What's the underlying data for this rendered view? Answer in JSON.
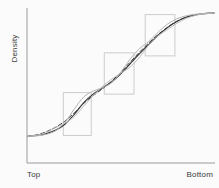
{
  "chart_data": {
    "type": "line",
    "title": "",
    "xlabel": "",
    "ylabel": "Density",
    "x_tick_labels": [
      "Top",
      "Bottom"
    ],
    "grid": false,
    "legend": false,
    "xlim": [
      0,
      1
    ],
    "ylim": [
      0,
      1
    ],
    "axis_color": "#9a9a9a",
    "highlight_boxes": [
      {
        "name": "lower-transition-box",
        "x0": 0.19,
        "x1": 0.34,
        "y0": 0.18,
        "y1": 0.46,
        "color": "#cccccc"
      },
      {
        "name": "middle-transition-box",
        "x0": 0.41,
        "x1": 0.57,
        "y0": 0.45,
        "y1": 0.72,
        "color": "#cccccc"
      },
      {
        "name": "upper-transition-box",
        "x0": 0.63,
        "x1": 0.79,
        "y0": 0.7,
        "y1": 0.97,
        "color": "#cccccc"
      }
    ],
    "series": [
      {
        "name": "observed-density",
        "style": "solid",
        "color": "#2e2e2e",
        "width": 1.1,
        "x": [
          0.0,
          0.05,
          0.1,
          0.15,
          0.2,
          0.25,
          0.3,
          0.35,
          0.4,
          0.45,
          0.5,
          0.55,
          0.6,
          0.65,
          0.7,
          0.75,
          0.8,
          0.85,
          0.9,
          0.95,
          1.0
        ],
        "y": [
          0.175,
          0.18,
          0.192,
          0.215,
          0.255,
          0.32,
          0.395,
          0.45,
          0.49,
          0.53,
          0.585,
          0.65,
          0.715,
          0.775,
          0.835,
          0.885,
          0.925,
          0.952,
          0.968,
          0.976,
          0.98
        ]
      },
      {
        "name": "fitted-density",
        "style": "dashed",
        "color": "#3c3c3c",
        "width": 1.0,
        "x": [
          0.0,
          0.05,
          0.1,
          0.15,
          0.2,
          0.25,
          0.3,
          0.35,
          0.4,
          0.45,
          0.5,
          0.55,
          0.6,
          0.65,
          0.7,
          0.75,
          0.8,
          0.85,
          0.9,
          0.95,
          1.0
        ],
        "y": [
          0.175,
          0.185,
          0.205,
          0.235,
          0.275,
          0.33,
          0.39,
          0.44,
          0.485,
          0.535,
          0.595,
          0.66,
          0.725,
          0.785,
          0.84,
          0.888,
          0.926,
          0.953,
          0.969,
          0.977,
          0.981
        ]
      },
      {
        "name": "upper-envelope",
        "style": "solid",
        "color": "#b4b4b4",
        "width": 1.0,
        "x": [
          0.0,
          0.05,
          0.1,
          0.15,
          0.2,
          0.25,
          0.3,
          0.35,
          0.4,
          0.45,
          0.5,
          0.55,
          0.6,
          0.65,
          0.7,
          0.75,
          0.8,
          0.85,
          0.9,
          0.95,
          1.0
        ],
        "y": [
          0.175,
          0.178,
          0.188,
          0.212,
          0.268,
          0.355,
          0.432,
          0.47,
          0.492,
          0.525,
          0.595,
          0.68,
          0.748,
          0.795,
          0.855,
          0.908,
          0.942,
          0.962,
          0.972,
          0.978,
          0.981
        ]
      },
      {
        "name": "lower-envelope",
        "style": "solid",
        "color": "#bcbcbc",
        "width": 1.0,
        "x": [
          0.0,
          0.05,
          0.1,
          0.15,
          0.2,
          0.25,
          0.3,
          0.35,
          0.4,
          0.45,
          0.5,
          0.55,
          0.6,
          0.65,
          0.7,
          0.75,
          0.8,
          0.85,
          0.9,
          0.95,
          1.0
        ],
        "y": [
          0.175,
          0.182,
          0.2,
          0.232,
          0.262,
          0.305,
          0.372,
          0.44,
          0.5,
          0.548,
          0.588,
          0.628,
          0.692,
          0.772,
          0.832,
          0.872,
          0.912,
          0.945,
          0.965,
          0.975,
          0.98
        ]
      }
    ]
  },
  "labels": {
    "ylabel": "Density",
    "x_left": "Top",
    "x_right": "Bottom"
  }
}
